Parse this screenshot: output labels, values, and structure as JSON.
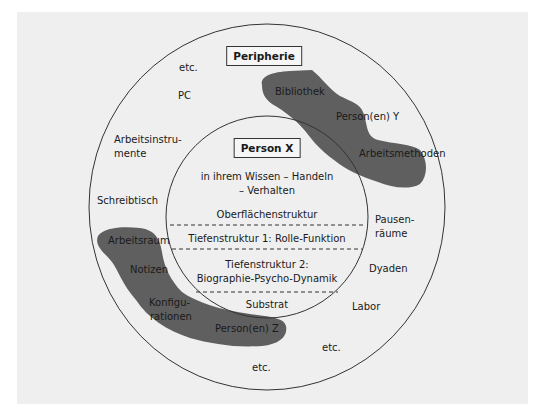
{
  "diagram": {
    "outer_title": "Peripherie",
    "inner_title": "Person X",
    "inner_layers": [
      {
        "id": "knowledge",
        "lines": [
          "in ihrem Wissen – Handeln",
          "– Verhalten"
        ]
      },
      {
        "id": "surface",
        "lines": [
          "Oberflächenstruktur"
        ]
      },
      {
        "id": "deep1",
        "lines": [
          "Tiefenstruktur 1: Rolle-Funktion"
        ]
      },
      {
        "id": "deep2",
        "lines": [
          "Tiefenstruktur 2:",
          "Biographie-Psycho-Dynamik"
        ]
      },
      {
        "id": "substrate",
        "lines": [
          "Substrat"
        ]
      }
    ],
    "periphery_labels": {
      "etc_top": "etc.",
      "pc": "PC",
      "arbeitsinstrumente_1": "Arbeitsinstru-",
      "arbeitsinstrumente_2": "mente",
      "schreibtisch": "Schreibtisch",
      "pausenraeume_1": "Pausen-",
      "pausenraeume_2": "räume",
      "dyaden": "Dyaden",
      "labor": "Labor",
      "etc_bottom_right": "etc.",
      "etc_bottom": "etc."
    },
    "blob_top_right": {
      "labels": [
        "Bibliothek",
        "Person(en) Y",
        "Arbeitsmethoden"
      ]
    },
    "blob_bottom_left": {
      "labels": [
        "Arbeitsraum",
        "Notizen",
        "Konfigu-",
        "rationen",
        "Person(en) Z"
      ]
    },
    "colors": {
      "background": "#efefef",
      "blob": "#5f5f5f",
      "line": "#333333"
    }
  }
}
